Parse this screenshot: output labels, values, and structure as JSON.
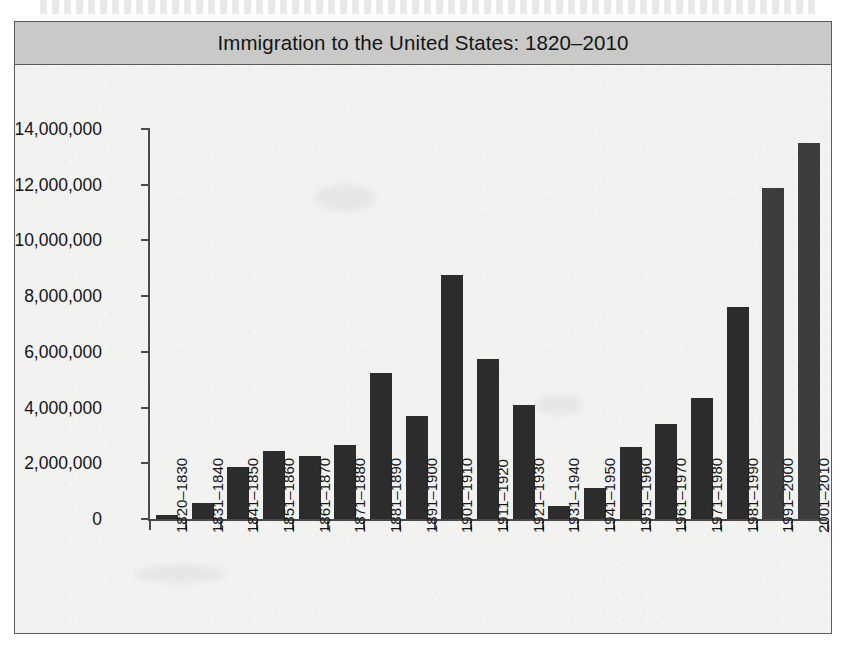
{
  "figure": {
    "title": "Immigration to the United States: 1820–2010",
    "background_color": "#f2f2f1",
    "title_bar_color": "#c9c9c8",
    "border_color": "#5a5a5a",
    "bar_color": "#2c2c2c",
    "bar_color_recent": "#3d3d3d",
    "axis_color": "#4a4a4a"
  },
  "chart_data": {
    "type": "bar",
    "title": "Immigration to the United States: 1820–2010",
    "xlabel": "",
    "ylabel": "",
    "ylim": [
      0,
      14000000
    ],
    "grid": false,
    "legend": null,
    "y_ticks": [
      0,
      2000000,
      4000000,
      6000000,
      8000000,
      10000000,
      12000000,
      14000000
    ],
    "y_tick_labels": [
      "0",
      "2,000,000",
      "4,000,000",
      "6,000,000",
      "8,000,000",
      "10,000,000",
      "12,000,000",
      "14,000,000"
    ],
    "categories": [
      "1820–1830",
      "1831–1840",
      "1841–1850",
      "1851–1860",
      "1861–1870",
      "1871–1880",
      "1881–1890",
      "1891–1900",
      "1901–1910",
      "1911–1920",
      "1921–1930",
      "1931–1940",
      "1941–1950",
      "1951–1960",
      "1961–1970",
      "1971–1980",
      "1981–1990",
      "1991–2000",
      "2001–2010"
    ],
    "values": [
      150000,
      560000,
      1850000,
      2450000,
      2250000,
      2650000,
      5250000,
      3700000,
      8750000,
      5750000,
      4100000,
      470000,
      1100000,
      2600000,
      3400000,
      4350000,
      7600000,
      11900000,
      13500000
    ]
  }
}
